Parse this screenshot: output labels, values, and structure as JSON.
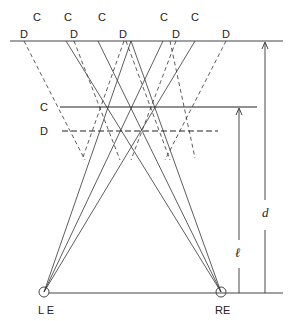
{
  "labels": {
    "c_top": [
      "C",
      "C",
      "C",
      "C",
      "C"
    ],
    "d_top": [
      "D",
      "D",
      "D",
      "D",
      "D"
    ],
    "c_side": "C",
    "d_side": "D",
    "d_dim": "d",
    "l_dim": "ℓ",
    "left_eye": "L E",
    "right_eye": "RE"
  },
  "geometry": {
    "top_y": 41,
    "c_plane_y": 107,
    "d_plane_y": 131,
    "eye_y": 292,
    "left_eye_x": 44,
    "right_eye_x": 221,
    "c_points_x": [
      66,
      98,
      131,
      163,
      195
    ],
    "d_points_x": [
      24,
      74,
      124,
      176,
      226
    ]
  }
}
